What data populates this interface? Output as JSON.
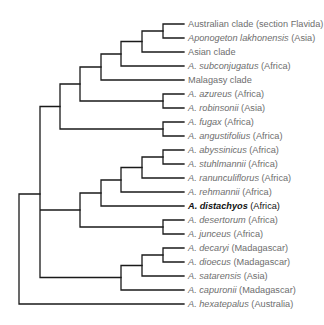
{
  "tree": {
    "leaves": [
      {
        "name": "",
        "qualifier": "Australian clade (section Flavida)"
      },
      {
        "name": "Aponogeton lakhonensis",
        "qualifier": " (Asia)"
      },
      {
        "name": "",
        "qualifier": "Asian clade"
      },
      {
        "name": "A. subconjugatus",
        "qualifier": " (Africa)"
      },
      {
        "name": "",
        "qualifier": "Malagasy clade"
      },
      {
        "name": "A. azureus",
        "qualifier": " (Africa)"
      },
      {
        "name": "A. robinsonii",
        "qualifier": " (Asia)"
      },
      {
        "name": "A. fugax",
        "qualifier": " (Africa)"
      },
      {
        "name": "A. angustifolius",
        "qualifier": " (Africa)"
      },
      {
        "name": "A. abyssinicus",
        "qualifier": " (Africa)"
      },
      {
        "name": "A. stuhlmannii",
        "qualifier": " (Africa)"
      },
      {
        "name": "A. ranunculiflorus",
        "qualifier": " (Africa)"
      },
      {
        "name": "A. rehmannii",
        "qualifier": " (Africa)"
      },
      {
        "name": "A. distachyos",
        "qualifier": " (Africa)",
        "highlight": true
      },
      {
        "name": "A. desertorum",
        "qualifier": " (Africa)"
      },
      {
        "name": "A. junceus",
        "qualifier": " (Africa)"
      },
      {
        "name": "A. decaryi",
        "qualifier": " (Madagascar)"
      },
      {
        "name": "A. dioecus",
        "qualifier": " (Madagascar)"
      },
      {
        "name": "A. satarensis",
        "qualifier": " (Asia)"
      },
      {
        "name": "A. capuronii",
        "qualifier": " (Madagascar)"
      },
      {
        "name": "A. hexatepalus",
        "qualifier": " (Australia)"
      }
    ],
    "line_color": "#1a1a1a",
    "label_color": "#6e6e6e",
    "highlight_color": "#111111"
  }
}
